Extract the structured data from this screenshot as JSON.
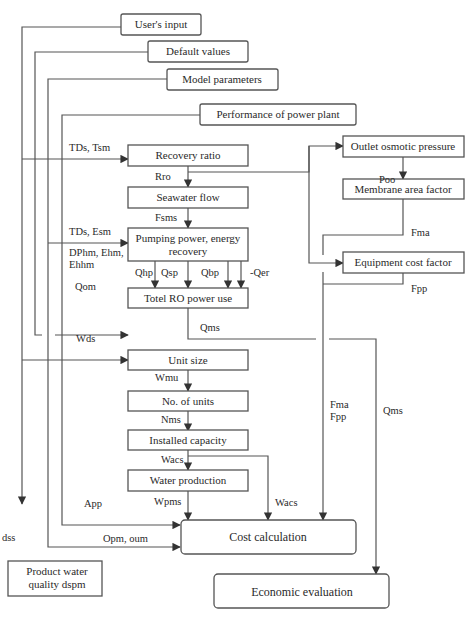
{
  "diagram": {
    "inputs": {
      "users_input": "User's input",
      "default_values": "Default values",
      "model_parameters": "Model parameters",
      "performance_power_plant": "Performance of power plant"
    },
    "boxes": {
      "recovery_ratio": "Recovery ratio",
      "seawater_flow": "Seawater flow",
      "pumping_line1": "Pumping power, energy",
      "pumping_line2": "recovery",
      "total_ro": "Totel RO power use",
      "unit_size": "Unit size",
      "no_of_units": "No. of units",
      "installed_capacity": "Installed capacity",
      "water_production": "Water production",
      "cost_calculation": "Cost calculation",
      "economic_evaluation": "Economic evaluation",
      "product_water_line1": "Product water",
      "product_water_line2": "quality dspm",
      "outlet_osmotic": "Outlet osmotic pressure",
      "membrane_area": "Membrane area factor",
      "equipment_cost": "Equipment cost factor"
    },
    "labels": {
      "tds_tsm": "TDs, Tsm",
      "rro": "Rro",
      "fsms": "Fsms",
      "tds_esm": "TDs, Esm",
      "dphm_line1": "DPhm, Ehm,",
      "dphm_line2": "Ehhm",
      "qom": "Qom",
      "qhp": "Qhp",
      "qsp": "Qsp",
      "qbp": "Qbp",
      "qer": "-Qer",
      "qms_1": "Qms",
      "wds": "Wds",
      "wmu": "Wmu",
      "nms": "Nms",
      "wacs_1": "Wacs",
      "wpms": "Wpms",
      "wacs_2": "Wacs",
      "app": "App",
      "opm_oum": "Opm, oum",
      "dss": "dss",
      "poo": "Poo",
      "fma": "Fma",
      "fpp": "Fpp",
      "fma_fpp_1": "Fma",
      "fma_fpp_2": "Fpp",
      "qms_2": "Qms"
    }
  }
}
